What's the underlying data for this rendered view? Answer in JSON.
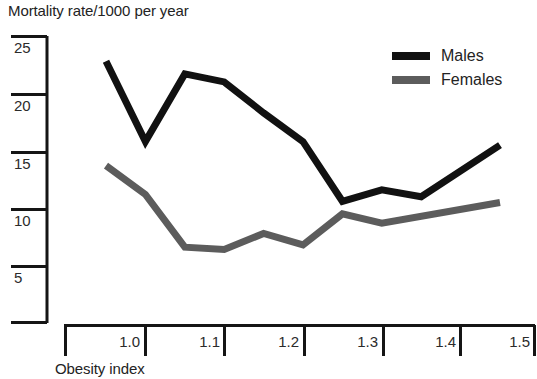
{
  "chart_data": {
    "type": "line",
    "title": "Mortality rate/1000 per year",
    "xlabel": "Obesity index",
    "ylabel": "Mortality rate/1000 per year",
    "x": [
      1.0,
      1.05,
      1.1,
      1.15,
      1.2,
      1.25,
      1.3,
      1.35,
      1.4,
      1.5
    ],
    "xlim": [
      0.95,
      1.5
    ],
    "ylim": [
      0,
      27
    ],
    "xticks": [
      1.0,
      1.1,
      1.2,
      1.3,
      1.4,
      1.5
    ],
    "xtick_labels": [
      "1.0",
      "1.1",
      "1.2",
      "1.3",
      "1.4",
      "1.5"
    ],
    "yticks": [
      5,
      10,
      15,
      20,
      25
    ],
    "ytick_labels": [
      "5",
      "10",
      "15",
      "20",
      "25"
    ],
    "grid": false,
    "legend_position": "top-right",
    "series": [
      {
        "name": "Males",
        "color": "#111111",
        "x": [
          1.0,
          1.05,
          1.1,
          1.15,
          1.2,
          1.25,
          1.3,
          1.35,
          1.4,
          1.5
        ],
        "values": [
          22.8,
          15.8,
          21.7,
          21.0,
          18.3,
          15.8,
          10.6,
          11.6,
          11.0,
          15.5
        ]
      },
      {
        "name": "Females",
        "color": "#5c5c5c",
        "x": [
          1.0,
          1.05,
          1.1,
          1.15,
          1.2,
          1.25,
          1.3,
          1.35,
          1.5
        ],
        "values": [
          13.7,
          11.2,
          6.6,
          6.4,
          7.8,
          6.8,
          9.5,
          8.7,
          10.5
        ]
      }
    ]
  },
  "legend": {
    "items": [
      {
        "label": "Males",
        "color": "#111111"
      },
      {
        "label": "Females",
        "color": "#5c5c5c"
      }
    ]
  },
  "axes": {
    "y_labels": [
      "25",
      "20",
      "15",
      "10",
      "5"
    ],
    "x_labels": [
      "1.0",
      "1.1",
      "1.2",
      "1.3",
      "1.4",
      "1.5"
    ]
  }
}
